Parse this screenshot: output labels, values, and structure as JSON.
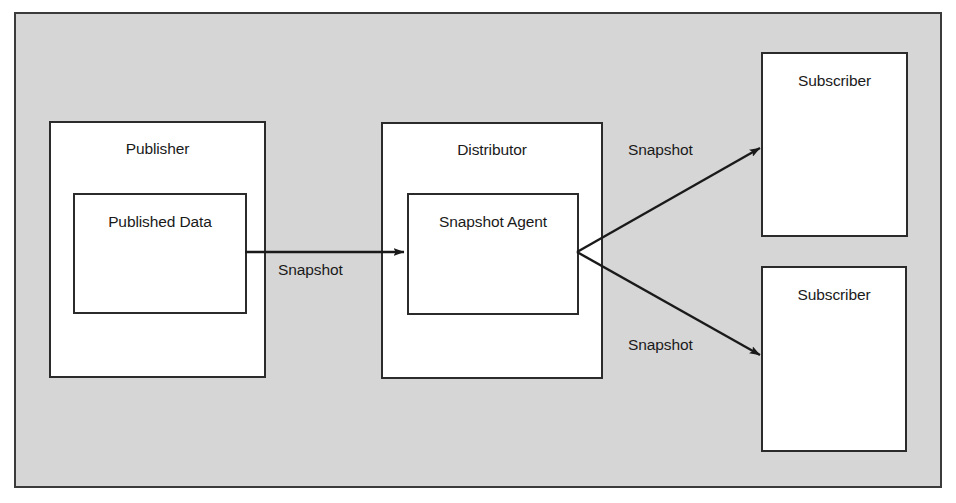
{
  "diagram": {
    "background_color": "#d6d6d6",
    "frame_border_color": "#3b3b3b",
    "node_fill_color": "#ffffff",
    "node_border_color": "#2b2b2b",
    "connector_color": "#1a1a1a",
    "nodes": [
      {
        "id": "publisher",
        "label": "Publisher"
      },
      {
        "id": "published-data",
        "label": "Published Data"
      },
      {
        "id": "distributor",
        "label": "Distributor"
      },
      {
        "id": "snapshot-agent",
        "label": "Snapshot Agent"
      },
      {
        "id": "subscriber-top",
        "label": "Subscriber"
      },
      {
        "id": "subscriber-bottom",
        "label": "Subscriber"
      }
    ],
    "edges": [
      {
        "id": "publisher-to-distributor",
        "label": "Snapshot",
        "from": "published-data",
        "to": "snapshot-agent",
        "direction": "right"
      },
      {
        "id": "distributor-to-subscriber-top",
        "label": "Snapshot",
        "from": "snapshot-agent",
        "to": "subscriber-top",
        "direction": "up-right"
      },
      {
        "id": "distributor-to-subscriber-bottom",
        "label": "Snapshot",
        "from": "snapshot-agent",
        "to": "subscriber-bottom",
        "direction": "down-right"
      }
    ]
  }
}
